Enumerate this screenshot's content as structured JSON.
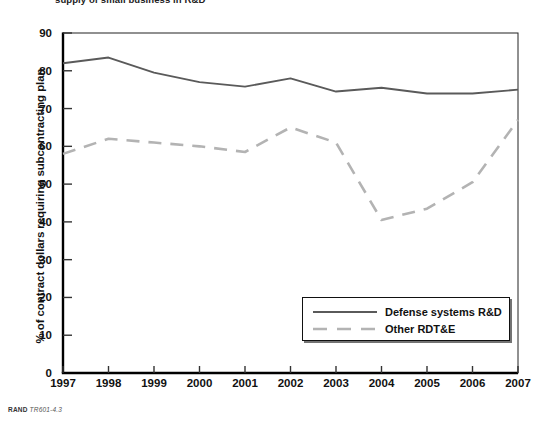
{
  "figure": {
    "top_caption": "supply of small business in R&D",
    "source_brand": "RAND",
    "source_code": "TR601-4.3"
  },
  "chart_data": {
    "type": "line",
    "title": "",
    "xlabel": "",
    "ylabel": "% of contract dollars requiring subcontracting plan",
    "categories": [
      "1997",
      "1998",
      "1999",
      "2000",
      "2001",
      "2002",
      "2003",
      "2004",
      "2005",
      "2006",
      "2007"
    ],
    "x": [
      1997,
      1998,
      1999,
      2000,
      2001,
      2002,
      2003,
      2004,
      2005,
      2006,
      2007
    ],
    "ylim": [
      0,
      90
    ],
    "xlim": [
      1997,
      2007
    ],
    "yticks": [
      0,
      10,
      20,
      30,
      40,
      50,
      60,
      70,
      80,
      90
    ],
    "grid": false,
    "legend_position": "bottom-right",
    "series": [
      {
        "name": "Defense systems R&D",
        "style": "solid",
        "color": "#5a5a5a",
        "values": [
          82.0,
          83.5,
          79.5,
          77.0,
          75.8,
          78.0,
          74.5,
          75.5,
          74.0,
          74.0,
          75.0
        ]
      },
      {
        "name": "Other RDT&E",
        "style": "dashed",
        "color": "#b3b3b3",
        "values": [
          58.0,
          62.0,
          61.0,
          60.0,
          58.5,
          65.0,
          61.0,
          40.5,
          43.5,
          50.5,
          67.0
        ]
      }
    ]
  },
  "legend": {
    "items": [
      {
        "label": "Defense systems R&D",
        "style": "solid",
        "color": "#5a5a5a"
      },
      {
        "label": "Other RDT&E",
        "style": "dashed",
        "color": "#b3b3b3"
      }
    ]
  }
}
